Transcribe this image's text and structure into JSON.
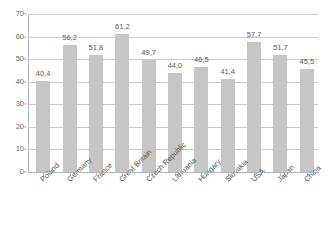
{
  "chart_data": {
    "type": "bar",
    "title": "",
    "subtitle": "",
    "xlabel": "",
    "ylabel": "",
    "ylim": [
      0,
      70
    ],
    "y_ticks": [
      0,
      10,
      20,
      30,
      40,
      50,
      60,
      70
    ],
    "y_tick_labels": [
      "0",
      "10",
      "20",
      "30",
      "40",
      "50",
      "60",
      "70"
    ],
    "grid": true,
    "grid_orientation": "horizontal",
    "legend": false,
    "legend_position": "none",
    "decimal_separator": ",",
    "bar_color": "#c6c6c6",
    "grid_color": "#c9cdd1",
    "axis_color": "#b3b7bb",
    "label_color": "#555555",
    "categories": [
      "Poland",
      "Germany",
      "France",
      "Great Britain",
      "Czech Republic",
      "Lithuania",
      "Hungary",
      "Slovakia",
      "USA",
      "Japan",
      "China"
    ],
    "values": [
      40.4,
      56.2,
      51.8,
      61.2,
      49.7,
      44.0,
      46.5,
      41.4,
      57.7,
      51.7,
      45.5
    ],
    "value_labels": [
      "40,4",
      "56,2",
      "51,8",
      "61,2",
      "49,7",
      "44,0",
      "46,5",
      "41,4",
      "57,7",
      "51,7",
      "45,5"
    ]
  }
}
